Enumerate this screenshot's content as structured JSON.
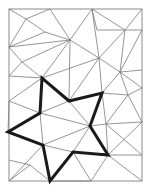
{
  "diagram": {
    "type": "triangulated-rectangle-with-star",
    "frame": {
      "x": 9,
      "y": 9,
      "width": 133,
      "height": 172
    },
    "colors": {
      "mesh": "#7a7a7a",
      "frame": "#8a8a8a",
      "star": "#1a1a1a",
      "background": "#ffffff"
    },
    "mesh_edges": [
      [
        9,
        9,
        26,
        19
      ],
      [
        26,
        19,
        50,
        9
      ],
      [
        26,
        19,
        45,
        32
      ],
      [
        9,
        47,
        26,
        19
      ],
      [
        50,
        9,
        70,
        40
      ],
      [
        45,
        32,
        70,
        40
      ],
      [
        9,
        47,
        45,
        32
      ],
      [
        9,
        47,
        70,
        40
      ],
      [
        70,
        40,
        92,
        9
      ],
      [
        92,
        9,
        97,
        30
      ],
      [
        92,
        9,
        99,
        58
      ],
      [
        70,
        40,
        99,
        58
      ],
      [
        97,
        30,
        125,
        30
      ],
      [
        92,
        9,
        125,
        30
      ],
      [
        125,
        30,
        142,
        9
      ],
      [
        125,
        30,
        142,
        30
      ],
      [
        125,
        30,
        99,
        58
      ],
      [
        125,
        30,
        120,
        72
      ],
      [
        99,
        58,
        120,
        72
      ],
      [
        120,
        72,
        142,
        30
      ],
      [
        120,
        72,
        142,
        70
      ],
      [
        9,
        47,
        22,
        62
      ],
      [
        22,
        62,
        70,
        40
      ],
      [
        22,
        62,
        9,
        76
      ],
      [
        22,
        62,
        42,
        78
      ],
      [
        70,
        40,
        42,
        78
      ],
      [
        70,
        40,
        69,
        101
      ],
      [
        99,
        58,
        42,
        78
      ],
      [
        99,
        58,
        69,
        101
      ],
      [
        99,
        58,
        102,
        93
      ],
      [
        120,
        72,
        102,
        93
      ],
      [
        120,
        72,
        142,
        88
      ],
      [
        102,
        93,
        128,
        95
      ],
      [
        128,
        95,
        142,
        88
      ],
      [
        128,
        95,
        142,
        122
      ],
      [
        120,
        72,
        128,
        95
      ],
      [
        9,
        76,
        42,
        78
      ],
      [
        9,
        101,
        42,
        78
      ],
      [
        9,
        101,
        40,
        113
      ],
      [
        9,
        101,
        8,
        132
      ],
      [
        42,
        78,
        69,
        101
      ],
      [
        40,
        113,
        69,
        101
      ],
      [
        40,
        113,
        90,
        126
      ],
      [
        69,
        101,
        90,
        126
      ],
      [
        102,
        93,
        106,
        124
      ],
      [
        106,
        124,
        90,
        126
      ],
      [
        106,
        124,
        128,
        95
      ],
      [
        106,
        124,
        142,
        122
      ],
      [
        106,
        124,
        108,
        155
      ],
      [
        106,
        124,
        142,
        155
      ],
      [
        40,
        113,
        43,
        145
      ],
      [
        8,
        132,
        43,
        145
      ],
      [
        43,
        145,
        90,
        126
      ],
      [
        43,
        145,
        73,
        152
      ],
      [
        90,
        126,
        73,
        152
      ],
      [
        9,
        181,
        43,
        145
      ],
      [
        9,
        160,
        30,
        165
      ],
      [
        30,
        165,
        50,
        181
      ],
      [
        9,
        181,
        30,
        165
      ],
      [
        73,
        152,
        91,
        181
      ],
      [
        108,
        155,
        91,
        181
      ],
      [
        108,
        155,
        142,
        181
      ],
      [
        108,
        155,
        142,
        155
      ],
      [
        142,
        122,
        108,
        155
      ],
      [
        50,
        181,
        91,
        181
      ]
    ],
    "star_polygon": [
      [
        42,
        78
      ],
      [
        40,
        113
      ],
      [
        8,
        132
      ],
      [
        43,
        145
      ],
      [
        50,
        181
      ],
      [
        73,
        152
      ],
      [
        108,
        155
      ],
      [
        90,
        126
      ],
      [
        102,
        93
      ],
      [
        69,
        101
      ]
    ]
  }
}
